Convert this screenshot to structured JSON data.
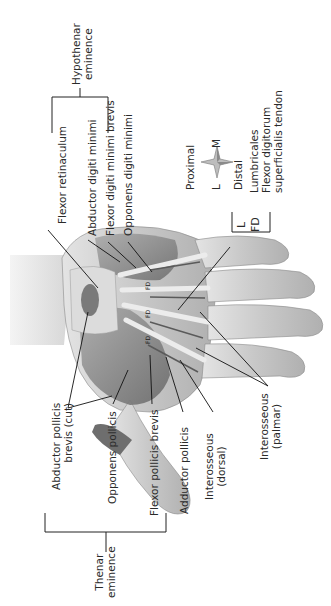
{
  "diagram": {
    "orientation_compass": {
      "proximal": "Proximal",
      "distal": "Distal",
      "lateral": "L",
      "medial": "M"
    },
    "groups": {
      "hypothenar": {
        "label_line1": "Hypothenar",
        "label_line2": "eminence",
        "muscles": [
          "Abductor digiti minimi",
          "Flexor digiti minimi brevis",
          "Opponens digiti minimi"
        ]
      },
      "thenar": {
        "label_line1": "Thenar",
        "label_line2": "eminence",
        "muscles": [
          "Abductor pollicis brevis (cut)",
          "Opponens pollicis",
          "Flexor pollicis brevis"
        ]
      }
    },
    "labels": {
      "flexor_retinaculum": "Flexor retinaculum",
      "abductor_digiti_minimi": "Abductor digiti minimi",
      "flexor_digiti_minimi_brevis": "Flexor digiti minimi brevis",
      "opponens_digiti_minimi": "Opponens digiti minimi",
      "lumbricales": "Lumbricales",
      "flexor_digitorum_line1": "Flexor digitorum",
      "flexor_digitorum_line2": "superficialis tendon",
      "legend_L": "L",
      "legend_FD": "FD",
      "abductor_pollicis_brevis_line1": "Abductor pollicis",
      "abductor_pollicis_brevis_line2": "brevis (cut)",
      "opponens_pollicis": "Opponens pollicis",
      "flexor_pollicis_brevis": "Flexor pollicis brevis",
      "adductor_pollicis": "Adductor pollicis",
      "interosseous_dorsal_line1": "Interosseous",
      "interosseous_dorsal_line2": "(dorsal)",
      "interosseous_palmar_line1": "Interosseous",
      "interosseous_palmar_line2": "(palmar)"
    },
    "colors": {
      "skin": "#c9c9c9",
      "muscle": "#8f8f8f",
      "tendon": "#e6e6e6",
      "leader": "#111111"
    }
  }
}
